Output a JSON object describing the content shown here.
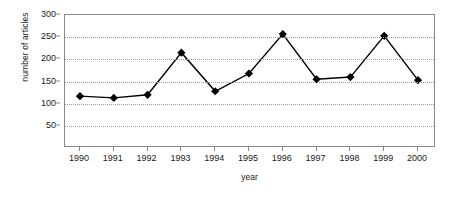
{
  "chart_data": {
    "type": "line",
    "title": "",
    "xlabel": "year",
    "ylabel": "number of articles",
    "categories": [
      "1990",
      "1991",
      "1992",
      "1993",
      "1994",
      "1995",
      "1996",
      "1997",
      "1998",
      "1999",
      "2000"
    ],
    "values": [
      117,
      113,
      120,
      215,
      128,
      168,
      257,
      155,
      160,
      253,
      153
    ],
    "series": [
      {
        "name": "number of articles",
        "values": [
          117,
          113,
          120,
          215,
          128,
          168,
          257,
          155,
          160,
          253,
          153
        ]
      }
    ],
    "x": [
      1990,
      1991,
      1992,
      1993,
      1994,
      1995,
      1996,
      1997,
      1998,
      1999,
      2000
    ],
    "xlim": [
      1989.5,
      2000.6
    ],
    "ylim": [
      0,
      300
    ],
    "yticks": [
      50,
      100,
      150,
      200,
      250,
      300
    ],
    "ytick_labels": [
      "50",
      "100",
      "150",
      "200",
      "250",
      "300"
    ],
    "xtick_labels": [
      "1990",
      "1991",
      "1992",
      "1993",
      "1994",
      "1995",
      "1996",
      "1997",
      "1998",
      "1999",
      "2000"
    ],
    "grid": true,
    "grid_axis": "y",
    "legend": null,
    "marker": "diamond",
    "marker_color": "#000000",
    "line_color": "#000000",
    "line_width": 1.4,
    "axes_color": "#8a8a8a",
    "grid_color": "#9a9a9a",
    "background": "#ffffff",
    "text_color": "#1a1a1a",
    "annotations": []
  }
}
